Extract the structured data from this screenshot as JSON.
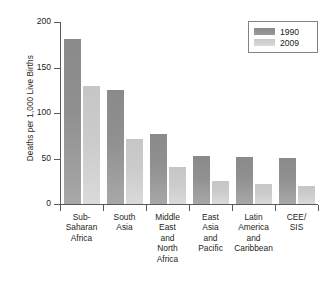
{
  "chart_data": {
    "type": "bar",
    "title": "",
    "xlabel": "",
    "ylabel": "Deaths per 1,000 Live Births",
    "ylim": [
      0,
      200
    ],
    "yticks": [
      0,
      50,
      100,
      150,
      200
    ],
    "ytick_labels": [
      "0",
      "50",
      "100",
      "150",
      "200"
    ],
    "grid": false,
    "legend_position": "top-right",
    "categories": [
      "Sub-\nSaharan\nAfrica",
      "South\nAsia",
      "Middle\nEast\nand\nNorth\nAfrica",
      "East\nAsia\nand\nPacific",
      "Latin\nAmerica\nand\nCaribbean",
      "CEE/\nSIS"
    ],
    "series": [
      {
        "name": "1990",
        "color": "#909090",
        "values": [
          181,
          125,
          77,
          53,
          52,
          51
        ]
      },
      {
        "name": "2009",
        "color": "#cbcbcb",
        "values": [
          130,
          71,
          41,
          25,
          22,
          20
        ]
      }
    ]
  },
  "legend": {
    "items": [
      {
        "label": "1990"
      },
      {
        "label": "2009"
      }
    ]
  }
}
